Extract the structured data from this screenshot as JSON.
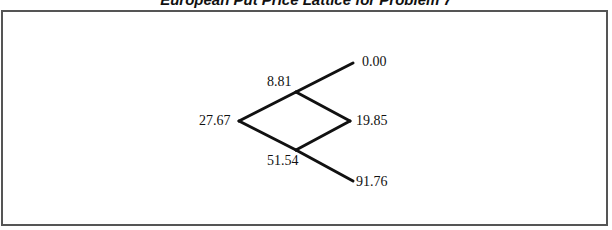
{
  "title": "European Put Price Lattice for Problem 7",
  "lattice": {
    "root": "27.67",
    "up": "8.81",
    "down": "51.54",
    "up_up": "0.00",
    "up_down": "19.85",
    "down_down": "91.76"
  },
  "colors": {
    "line": "#111111",
    "frame": "#555555",
    "background": "#ffffff"
  }
}
